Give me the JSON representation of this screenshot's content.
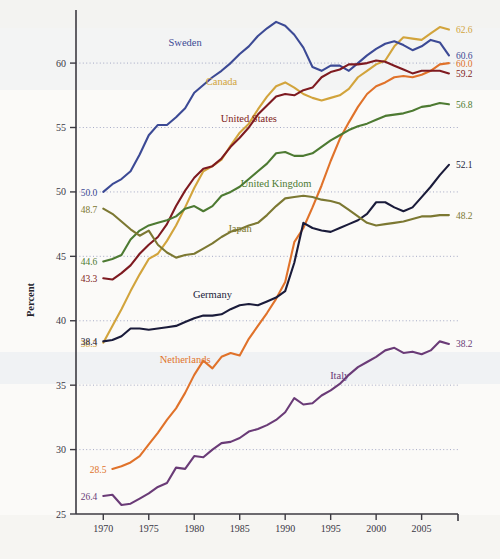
{
  "chart_data": {
    "type": "line",
    "title": "",
    "xlabel": "",
    "ylabel": "Percent",
    "xlim": [
      1967,
      2009
    ],
    "ylim": [
      25,
      63.5
    ],
    "grid": true,
    "legend_position": "inline-labels",
    "xticks": [
      1970,
      1975,
      1980,
      1985,
      1990,
      1995,
      2000,
      2005
    ],
    "yticks": [
      25,
      30,
      35,
      40,
      45,
      50,
      55,
      60
    ],
    "series": [
      {
        "name": "Canada",
        "color": "#d2a43c",
        "start_value": "38.3",
        "end_value": "62.6",
        "label_x": 1983,
        "label_y": 58.3,
        "x": [
          1970,
          1971,
          1972,
          1973,
          1974,
          1975,
          1976,
          1977,
          1978,
          1979,
          1980,
          1981,
          1982,
          1983,
          1984,
          1985,
          1986,
          1987,
          1988,
          1989,
          1990,
          1991,
          1992,
          1993,
          1994,
          1995,
          1996,
          1997,
          1998,
          1999,
          2000,
          2001,
          2002,
          2003,
          2004,
          2005,
          2006,
          2007,
          2008
        ],
        "values": [
          38.3,
          39.6,
          40.9,
          42.3,
          43.6,
          44.8,
          45.2,
          46.2,
          47.4,
          48.8,
          50.3,
          51.6,
          52.0,
          52.5,
          53.6,
          54.6,
          55.3,
          56.4,
          57.4,
          58.2,
          58.5,
          58.1,
          57.6,
          57.3,
          57.1,
          57.3,
          57.5,
          58.0,
          58.9,
          59.4,
          59.9,
          60.2,
          61.3,
          62.0,
          61.9,
          61.8,
          62.3,
          62.8,
          62.6
        ]
      },
      {
        "name": "Sweden",
        "color": "#3c4a95",
        "start_value": "50.0",
        "end_value": "60.6",
        "label_x": 1979,
        "label_y": 61.3,
        "x": [
          1970,
          1971,
          1972,
          1973,
          1974,
          1975,
          1976,
          1977,
          1978,
          1979,
          1980,
          1981,
          1982,
          1983,
          1984,
          1985,
          1986,
          1987,
          1988,
          1989,
          1990,
          1991,
          1992,
          1993,
          1994,
          1995,
          1996,
          1997,
          1998,
          1999,
          2000,
          2001,
          2002,
          2003,
          2004,
          2005,
          2006,
          2007,
          2008
        ],
        "values": [
          50.0,
          50.6,
          51.0,
          51.6,
          52.9,
          54.4,
          55.2,
          55.2,
          55.8,
          56.5,
          57.7,
          58.3,
          58.9,
          59.4,
          60.0,
          60.7,
          61.3,
          62.1,
          62.7,
          63.2,
          62.9,
          62.2,
          61.2,
          59.7,
          59.4,
          59.8,
          59.8,
          59.4,
          60.0,
          60.6,
          61.1,
          61.5,
          61.7,
          61.4,
          61.0,
          61.3,
          61.8,
          61.6,
          60.6
        ]
      },
      {
        "name": "Netherlands",
        "color": "#e0722a",
        "start_value": "28.5",
        "end_value": "60.0",
        "label_x": 1979,
        "label_y": 36.7,
        "x": [
          1971,
          1972,
          1973,
          1974,
          1975,
          1976,
          1977,
          1978,
          1979,
          1980,
          1981,
          1982,
          1983,
          1984,
          1985,
          1986,
          1987,
          1988,
          1989,
          1990,
          1991,
          1992,
          1993,
          1994,
          1995,
          1996,
          1997,
          1998,
          1999,
          2000,
          2001,
          2002,
          2003,
          2004,
          2005,
          2006,
          2007,
          2008
        ],
        "values": [
          28.5,
          28.7,
          29.0,
          29.5,
          30.4,
          31.3,
          32.3,
          33.2,
          34.4,
          35.8,
          36.9,
          36.3,
          37.2,
          37.5,
          37.3,
          38.6,
          39.6,
          40.6,
          41.7,
          43.0,
          46.1,
          47.2,
          48.8,
          50.5,
          52.4,
          54.1,
          55.4,
          56.6,
          57.6,
          58.2,
          58.5,
          58.9,
          59.0,
          58.9,
          59.1,
          59.4,
          59.9,
          60.0
        ]
      },
      {
        "name": "United States",
        "color": "#7e1a20",
        "start_value": "43.3",
        "end_value": "59.2",
        "label_x": 1986,
        "label_y": 55.4,
        "x": [
          1970,
          1971,
          1972,
          1973,
          1974,
          1975,
          1976,
          1977,
          1978,
          1979,
          1980,
          1981,
          1982,
          1983,
          1984,
          1985,
          1986,
          1987,
          1988,
          1989,
          1990,
          1991,
          1992,
          1993,
          1994,
          1995,
          1996,
          1997,
          1998,
          1999,
          2000,
          2001,
          2002,
          2003,
          2004,
          2005,
          2006,
          2007,
          2008
        ],
        "values": [
          43.3,
          43.2,
          43.7,
          44.3,
          45.2,
          45.9,
          46.5,
          47.5,
          48.9,
          50.1,
          51.1,
          51.8,
          52.0,
          52.6,
          53.5,
          54.2,
          55.0,
          56.0,
          56.7,
          57.4,
          57.6,
          57.5,
          57.9,
          58.1,
          58.9,
          59.3,
          59.5,
          59.9,
          59.9,
          60.0,
          60.2,
          60.1,
          59.8,
          59.5,
          59.2,
          59.4,
          59.4,
          59.4,
          59.2
        ]
      },
      {
        "name": "United Kingdom",
        "color": "#4d7a32",
        "start_value": "44.6",
        "end_value": "56.8",
        "label_x": 1989,
        "label_y": 50.4,
        "x": [
          1970,
          1971,
          1972,
          1973,
          1974,
          1975,
          1976,
          1977,
          1978,
          1979,
          1980,
          1981,
          1982,
          1983,
          1984,
          1985,
          1986,
          1987,
          1988,
          1989,
          1990,
          1991,
          1992,
          1993,
          1994,
          1995,
          1996,
          1997,
          1998,
          1999,
          2000,
          2001,
          2002,
          2003,
          2004,
          2005,
          2006,
          2007,
          2008
        ],
        "values": [
          44.6,
          44.8,
          45.1,
          46.3,
          47.0,
          47.4,
          47.6,
          47.8,
          48.1,
          48.7,
          48.9,
          48.5,
          48.9,
          49.7,
          50.0,
          50.4,
          51.0,
          51.6,
          52.2,
          53.0,
          53.1,
          52.8,
          52.8,
          53.0,
          53.5,
          54.0,
          54.4,
          54.8,
          55.1,
          55.3,
          55.6,
          55.9,
          56.0,
          56.1,
          56.3,
          56.6,
          56.7,
          56.9,
          56.8
        ]
      },
      {
        "name": "Germany",
        "color": "#1a1b3a",
        "start_value": "38.4",
        "end_value": "52.1",
        "label_x": 1982,
        "label_y": 41.8,
        "x": [
          1970,
          1971,
          1972,
          1973,
          1974,
          1975,
          1976,
          1977,
          1978,
          1979,
          1980,
          1981,
          1982,
          1983,
          1984,
          1985,
          1986,
          1987,
          1988,
          1989,
          1990,
          1991,
          1992,
          1993,
          1994,
          1995,
          1996,
          1997,
          1998,
          1999,
          2000,
          2001,
          2002,
          2003,
          2004,
          2005,
          2006,
          2007,
          2008
        ],
        "values": [
          38.4,
          38.5,
          38.8,
          39.4,
          39.4,
          39.3,
          39.4,
          39.5,
          39.6,
          39.9,
          40.2,
          40.4,
          40.4,
          40.5,
          40.9,
          41.2,
          41.3,
          41.2,
          41.5,
          41.8,
          42.3,
          44.5,
          47.6,
          47.2,
          47.0,
          46.9,
          47.2,
          47.5,
          47.8,
          48.3,
          49.2,
          49.2,
          48.8,
          48.5,
          48.8,
          49.6,
          50.4,
          51.3,
          52.1
        ]
      },
      {
        "name": "Japan",
        "color": "#7c7832",
        "start_value": "48.7",
        "end_value": "48.2",
        "label_x": 1985,
        "label_y": 46.9,
        "x": [
          1970,
          1971,
          1972,
          1973,
          1974,
          1975,
          1976,
          1977,
          1978,
          1979,
          1980,
          1981,
          1982,
          1983,
          1984,
          1985,
          1986,
          1987,
          1988,
          1989,
          1990,
          1991,
          1992,
          1993,
          1994,
          1995,
          1996,
          1997,
          1998,
          1999,
          2000,
          2001,
          2002,
          2003,
          2004,
          2005,
          2006,
          2007,
          2008
        ],
        "values": [
          48.7,
          48.3,
          47.7,
          47.1,
          46.6,
          47.0,
          45.9,
          45.3,
          44.9,
          45.1,
          45.2,
          45.6,
          46.0,
          46.5,
          46.9,
          47.1,
          47.4,
          47.6,
          48.2,
          48.9,
          49.5,
          49.6,
          49.7,
          49.6,
          49.4,
          49.3,
          49.1,
          48.6,
          48.1,
          47.6,
          47.4,
          47.5,
          47.6,
          47.7,
          47.9,
          48.1,
          48.1,
          48.2,
          48.2
        ]
      },
      {
        "name": "Italy",
        "color": "#6a3b77",
        "start_value": "26.4",
        "end_value": "38.2",
        "label_x": 1996,
        "label_y": 35.5,
        "x": [
          1970,
          1971,
          1972,
          1973,
          1974,
          1975,
          1976,
          1977,
          1978,
          1979,
          1980,
          1981,
          1982,
          1983,
          1984,
          1985,
          1986,
          1987,
          1988,
          1989,
          1990,
          1991,
          1992,
          1993,
          1994,
          1995,
          1996,
          1997,
          1998,
          1999,
          2000,
          2001,
          2002,
          2003,
          2004,
          2005,
          2006,
          2007,
          2008
        ],
        "values": [
          26.4,
          26.5,
          25.7,
          25.8,
          26.2,
          26.6,
          27.1,
          27.4,
          28.6,
          28.5,
          29.5,
          29.4,
          30.0,
          30.5,
          30.6,
          30.9,
          31.4,
          31.6,
          31.9,
          32.3,
          32.9,
          34.0,
          33.5,
          33.6,
          34.2,
          34.6,
          35.1,
          35.8,
          36.4,
          36.8,
          37.2,
          37.7,
          37.9,
          37.5,
          37.6,
          37.4,
          37.7,
          38.4,
          38.2
        ]
      }
    ]
  }
}
